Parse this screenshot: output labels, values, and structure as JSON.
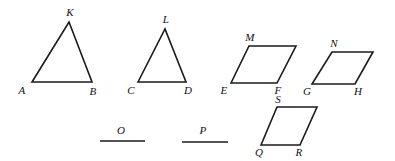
{
  "figure": {
    "stroke_color": "#1a1a1a",
    "background_color": "#ffffff",
    "width": 395,
    "height": 161,
    "shapes": [
      {
        "id": "triangle-akb",
        "kind": "triangle",
        "points": "32,82 69,22 92,82",
        "closed": true,
        "labels": [
          {
            "text": "A",
            "x": 22,
            "y": 90
          },
          {
            "text": "K",
            "x": 70,
            "y": 12
          },
          {
            "text": "B",
            "x": 93,
            "y": 91
          }
        ]
      },
      {
        "id": "triangle-cld",
        "kind": "triangle",
        "points": "138,82 165,29 186,82",
        "closed": true,
        "labels": [
          {
            "text": "C",
            "x": 131,
            "y": 90
          },
          {
            "text": "L",
            "x": 166,
            "y": 19
          },
          {
            "text": "D",
            "x": 188,
            "y": 90
          }
        ]
      },
      {
        "id": "parallelogram-emf",
        "kind": "parallelogram",
        "points": "231,83 249,46 296,46 277,83",
        "closed": true,
        "labels": [
          {
            "text": "E",
            "x": 224,
            "y": 90
          },
          {
            "text": "M",
            "x": 250,
            "y": 37
          },
          {
            "text": "F",
            "x": 278,
            "y": 90
          }
        ]
      },
      {
        "id": "parallelogram-gnh",
        "kind": "parallelogram",
        "points": "312,84 332,52 373,52 355,84",
        "closed": true,
        "labels": [
          {
            "text": "G",
            "x": 307,
            "y": 91
          },
          {
            "text": "N",
            "x": 334,
            "y": 43
          },
          {
            "text": "H",
            "x": 358,
            "y": 91
          }
        ]
      },
      {
        "id": "parallelogram-qsr",
        "kind": "parallelogram",
        "points": "261,145 277,107 317,107 300,145",
        "closed": true,
        "labels": [
          {
            "text": "Q",
            "x": 259,
            "y": 152
          },
          {
            "text": "S",
            "x": 278,
            "y": 99
          },
          {
            "text": "R",
            "x": 299,
            "y": 152
          }
        ]
      }
    ],
    "segments": [
      {
        "id": "segment-o",
        "kind": "line-segment",
        "points": "100,141 145,141",
        "labels": [
          {
            "text": "O",
            "x": 121,
            "y": 130
          }
        ]
      },
      {
        "id": "segment-p",
        "kind": "line-segment",
        "points": "182,142 228,142",
        "labels": [
          {
            "text": "P",
            "x": 203,
            "y": 130
          }
        ]
      }
    ]
  }
}
